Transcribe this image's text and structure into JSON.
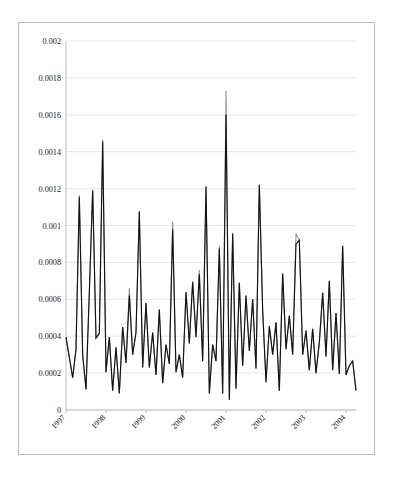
{
  "figure": {
    "name": "option-volume-timeseries-figure",
    "border_color": "#b9b9b9",
    "background": "#ffffff"
  },
  "chart_data": {
    "type": "line",
    "title": "",
    "subtitle": "",
    "xlabel": "",
    "ylabel": "",
    "xlim": [
      1997.0,
      2004.83
    ],
    "ylim": [
      0,
      0.002
    ],
    "grid": true,
    "grid_axis": "y",
    "legend_position": "bottom",
    "x_tick_labels": [
      "1997",
      "1998",
      "1999",
      "2000",
      "2001",
      "2002",
      "2003",
      "2004"
    ],
    "x_tick_values": [
      1997,
      1998,
      1999,
      2000,
      2001,
      2002,
      2003,
      2004
    ],
    "x_tick_rotation": 45,
    "y_tick_labels": [
      "0",
      "0.0002",
      "0.0004",
      "0.0006",
      "0.0008",
      "0.001",
      "0.0012",
      "0.0014",
      "0.0016",
      "0.0018",
      "0.002"
    ],
    "y_tick_values": [
      0,
      0.0002,
      0.0004,
      0.0006,
      0.0008,
      0.001,
      0.0012,
      0.0014,
      0.0016,
      0.0018,
      0.002
    ],
    "colors": {
      "put": "#8f8f8f",
      "call": "#141414"
    },
    "series": [
      {
        "name": "Put",
        "color": "#8f8f8f",
        "values": [
          0.000395,
          0.000285,
          0.000175,
          0.00033,
          0.001165,
          0.0003,
          0.000115,
          0.00064,
          0.001195,
          0.00039,
          0.000415,
          0.001465,
          0.000205,
          0.000395,
          0.000105,
          0.00034,
          9e-05,
          0.00045,
          0.000255,
          0.00066,
          0.0003,
          0.00042,
          0.00108,
          0.00023,
          0.00058,
          0.00023,
          0.00042,
          0.00019,
          0.000545,
          0.000145,
          0.000355,
          0.00025,
          0.00102,
          0.000205,
          0.0003,
          0.000175,
          0.00064,
          0.00036,
          0.000695,
          0.000395,
          0.00076,
          0.000265,
          0.001215,
          9e-05,
          0.000355,
          0.000265,
          0.00089,
          9e-05,
          0.00173,
          5.5e-05,
          0.00096,
          0.000115,
          0.00069,
          0.00024,
          0.00062,
          0.00032,
          0.0006,
          0.000225,
          0.001225,
          0.00054,
          0.00015,
          0.000455,
          0.0003,
          0.000475,
          0.000105,
          0.00074,
          0.00033,
          0.00051,
          0.0003,
          0.000955,
          0.00092,
          0.0003,
          0.00043,
          0.000215,
          0.00044,
          0.0002,
          0.000365,
          0.000635,
          0.00029,
          0.0007,
          0.000215,
          0.000525,
          0.000195,
          0.00089,
          0.00019,
          0.00024,
          0.000265,
          0.000105
        ]
      },
      {
        "name": "Call",
        "color": "#141414",
        "values": [
          0.000395,
          0.000285,
          0.000175,
          0.00033,
          0.001155,
          0.0003,
          0.00011,
          0.00064,
          0.00119,
          0.00039,
          0.000415,
          0.001455,
          0.000205,
          0.000395,
          0.000105,
          0.00034,
          9e-05,
          0.00045,
          0.000255,
          0.00062,
          0.0003,
          0.00042,
          0.001075,
          0.00023,
          0.00058,
          0.00023,
          0.00042,
          0.00019,
          0.000545,
          0.000145,
          0.000355,
          0.00025,
          0.00098,
          0.000205,
          0.0003,
          0.000175,
          0.00064,
          0.00036,
          0.000695,
          0.000395,
          0.000735,
          0.000265,
          0.00121,
          9e-05,
          0.000355,
          0.000265,
          0.000875,
          9e-05,
          0.0016,
          5.5e-05,
          0.000955,
          0.000115,
          0.00069,
          0.00024,
          0.00062,
          0.00032,
          0.0006,
          0.000225,
          0.00122,
          0.00054,
          0.00015,
          0.000455,
          0.0003,
          0.000475,
          0.000105,
          0.00074,
          0.00033,
          0.00051,
          0.0003,
          0.0009,
          0.00092,
          0.0003,
          0.00043,
          0.000215,
          0.00044,
          0.0002,
          0.000365,
          0.000635,
          0.00029,
          0.0007,
          0.000215,
          0.000525,
          0.000195,
          0.00089,
          0.00019,
          0.00024,
          0.000265,
          0.000105
        ]
      }
    ]
  },
  "legend": {
    "items": [
      {
        "label": "Put",
        "color": "#8f8f8f"
      },
      {
        "label": "Call",
        "color": "#141414"
      }
    ]
  }
}
